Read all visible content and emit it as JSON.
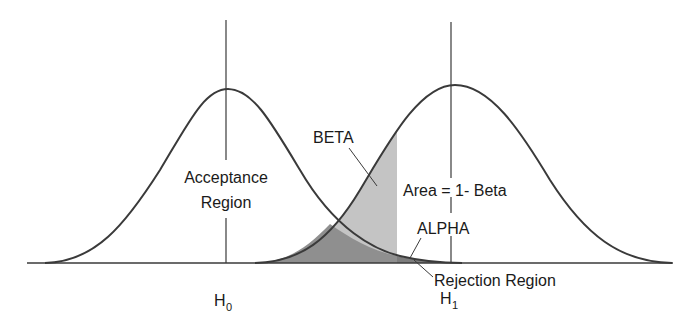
{
  "diagram": {
    "labels": {
      "beta": "BETA",
      "acceptance_line1": "Acceptance",
      "acceptance_line2": "Region",
      "power": "Area = 1- Beta",
      "alpha": "ALPHA",
      "rejection": "Rejection Region",
      "h0_main": "H",
      "h0_sub": "0",
      "h1_main": "H",
      "h1_sub": "1"
    },
    "colors": {
      "line": "#3a3a3a",
      "beta_fill": "#c4c4c4",
      "overlap_fill": "#8f8f8f",
      "alpha_fill": "#7d7d7d",
      "background": "#ffffff"
    },
    "geometry": {
      "baseline_y": 263,
      "baseline_x_start": 27,
      "baseline_x_end": 673,
      "h0_x": 226,
      "h1_x": 451,
      "critical_x": 397,
      "left_peak_y": 89,
      "right_peak_y": 85
    }
  }
}
